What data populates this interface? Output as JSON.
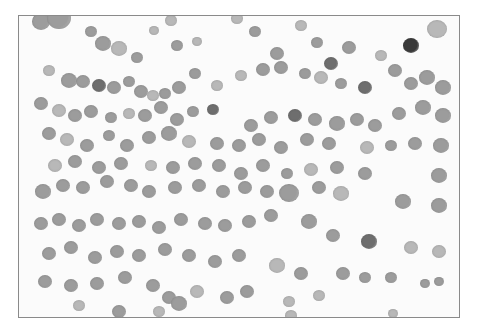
{
  "image": {
    "description": "Grayscale light micrograph of scattered round cells (cytology smear) within a thin gray border",
    "frame": {
      "x": 18,
      "y": 15,
      "width": 442,
      "height": 303,
      "border_color": "#8a8a8a",
      "background": "#fbfbfb"
    },
    "cell_colors": {
      "light": "#b8b8b8",
      "mid": "#9c9c9c",
      "dark": "#6e6e6e",
      "very_dark": "#3a3a3a"
    },
    "cells": [
      [
        22,
        6,
        9,
        "mid"
      ],
      [
        40,
        3,
        12,
        "mid"
      ],
      [
        72,
        16,
        6,
        "mid"
      ],
      [
        84,
        28,
        8,
        "mid"
      ],
      [
        100,
        33,
        8,
        "light"
      ],
      [
        118,
        42,
        6,
        "mid"
      ],
      [
        135,
        15,
        5,
        "light"
      ],
      [
        152,
        5,
        6,
        "light"
      ],
      [
        158,
        30,
        6,
        "mid"
      ],
      [
        178,
        26,
        5,
        "light"
      ],
      [
        218,
        3,
        6,
        "light"
      ],
      [
        236,
        16,
        6,
        "mid"
      ],
      [
        258,
        38,
        7,
        "mid"
      ],
      [
        282,
        10,
        6,
        "light"
      ],
      [
        298,
        27,
        6,
        "mid"
      ],
      [
        312,
        48,
        7,
        "dark"
      ],
      [
        330,
        32,
        7,
        "mid"
      ],
      [
        362,
        40,
        6,
        "light"
      ],
      [
        392,
        30,
        8,
        "very_dark"
      ],
      [
        418,
        14,
        10,
        "light"
      ],
      [
        30,
        55,
        6,
        "light"
      ],
      [
        50,
        65,
        8,
        "mid"
      ],
      [
        64,
        66,
        7,
        "mid"
      ],
      [
        80,
        70,
        7,
        "dark"
      ],
      [
        95,
        72,
        7,
        "mid"
      ],
      [
        110,
        66,
        6,
        "mid"
      ],
      [
        122,
        76,
        7,
        "mid"
      ],
      [
        134,
        80,
        6,
        "light"
      ],
      [
        146,
        78,
        6,
        "mid"
      ],
      [
        160,
        72,
        7,
        "mid"
      ],
      [
        176,
        58,
        6,
        "mid"
      ],
      [
        198,
        70,
        6,
        "light"
      ],
      [
        222,
        60,
        6,
        "light"
      ],
      [
        244,
        54,
        7,
        "mid"
      ],
      [
        262,
        52,
        7,
        "mid"
      ],
      [
        286,
        58,
        6,
        "mid"
      ],
      [
        302,
        62,
        7,
        "light"
      ],
      [
        322,
        68,
        6,
        "mid"
      ],
      [
        346,
        72,
        7,
        "dark"
      ],
      [
        376,
        55,
        7,
        "mid"
      ],
      [
        392,
        68,
        7,
        "mid"
      ],
      [
        408,
        62,
        8,
        "mid"
      ],
      [
        424,
        72,
        8,
        "mid"
      ],
      [
        22,
        88,
        7,
        "mid"
      ],
      [
        40,
        95,
        7,
        "light"
      ],
      [
        56,
        100,
        7,
        "mid"
      ],
      [
        72,
        96,
        7,
        "mid"
      ],
      [
        92,
        102,
        6,
        "mid"
      ],
      [
        110,
        98,
        6,
        "light"
      ],
      [
        126,
        100,
        7,
        "mid"
      ],
      [
        142,
        92,
        7,
        "mid"
      ],
      [
        158,
        104,
        7,
        "mid"
      ],
      [
        174,
        96,
        6,
        "mid"
      ],
      [
        194,
        94,
        6,
        "dark"
      ],
      [
        232,
        110,
        7,
        "mid"
      ],
      [
        252,
        102,
        7,
        "mid"
      ],
      [
        276,
        100,
        7,
        "dark"
      ],
      [
        296,
        104,
        7,
        "mid"
      ],
      [
        318,
        108,
        8,
        "mid"
      ],
      [
        338,
        104,
        7,
        "mid"
      ],
      [
        356,
        110,
        7,
        "mid"
      ],
      [
        380,
        98,
        7,
        "mid"
      ],
      [
        404,
        92,
        8,
        "mid"
      ],
      [
        424,
        100,
        8,
        "mid"
      ],
      [
        30,
        118,
        7,
        "mid"
      ],
      [
        48,
        124,
        7,
        "light"
      ],
      [
        68,
        130,
        7,
        "mid"
      ],
      [
        90,
        120,
        6,
        "mid"
      ],
      [
        108,
        130,
        7,
        "mid"
      ],
      [
        130,
        122,
        7,
        "mid"
      ],
      [
        150,
        118,
        8,
        "mid"
      ],
      [
        170,
        126,
        7,
        "light"
      ],
      [
        198,
        128,
        7,
        "mid"
      ],
      [
        220,
        130,
        7,
        "mid"
      ],
      [
        240,
        124,
        7,
        "mid"
      ],
      [
        262,
        132,
        7,
        "mid"
      ],
      [
        288,
        124,
        7,
        "mid"
      ],
      [
        310,
        128,
        7,
        "mid"
      ],
      [
        348,
        132,
        7,
        "light"
      ],
      [
        372,
        130,
        6,
        "mid"
      ],
      [
        396,
        128,
        7,
        "mid"
      ],
      [
        422,
        130,
        8,
        "mid"
      ],
      [
        36,
        150,
        7,
        "light"
      ],
      [
        56,
        146,
        7,
        "mid"
      ],
      [
        80,
        152,
        7,
        "mid"
      ],
      [
        102,
        148,
        7,
        "mid"
      ],
      [
        132,
        150,
        6,
        "light"
      ],
      [
        154,
        152,
        7,
        "mid"
      ],
      [
        176,
        148,
        7,
        "mid"
      ],
      [
        200,
        150,
        7,
        "mid"
      ],
      [
        222,
        158,
        7,
        "mid"
      ],
      [
        244,
        150,
        7,
        "mid"
      ],
      [
        268,
        158,
        6,
        "mid"
      ],
      [
        292,
        154,
        7,
        "light"
      ],
      [
        318,
        152,
        7,
        "mid"
      ],
      [
        346,
        158,
        7,
        "mid"
      ],
      [
        420,
        160,
        8,
        "mid"
      ],
      [
        24,
        176,
        8,
        "mid"
      ],
      [
        44,
        170,
        7,
        "mid"
      ],
      [
        64,
        172,
        7,
        "mid"
      ],
      [
        88,
        166,
        7,
        "mid"
      ],
      [
        112,
        170,
        7,
        "mid"
      ],
      [
        130,
        176,
        7,
        "mid"
      ],
      [
        156,
        172,
        7,
        "mid"
      ],
      [
        180,
        170,
        7,
        "mid"
      ],
      [
        204,
        176,
        7,
        "mid"
      ],
      [
        226,
        172,
        7,
        "mid"
      ],
      [
        248,
        176,
        7,
        "mid"
      ],
      [
        270,
        178,
        10,
        "mid"
      ],
      [
        300,
        172,
        7,
        "mid"
      ],
      [
        322,
        178,
        8,
        "light"
      ],
      [
        384,
        186,
        8,
        "mid"
      ],
      [
        420,
        190,
        8,
        "mid"
      ],
      [
        22,
        208,
        7,
        "mid"
      ],
      [
        40,
        204,
        7,
        "mid"
      ],
      [
        60,
        210,
        7,
        "mid"
      ],
      [
        78,
        204,
        7,
        "mid"
      ],
      [
        100,
        208,
        7,
        "mid"
      ],
      [
        120,
        206,
        7,
        "mid"
      ],
      [
        140,
        212,
        7,
        "mid"
      ],
      [
        162,
        204,
        7,
        "mid"
      ],
      [
        186,
        208,
        7,
        "mid"
      ],
      [
        206,
        210,
        7,
        "mid"
      ],
      [
        230,
        206,
        7,
        "mid"
      ],
      [
        252,
        200,
        7,
        "mid"
      ],
      [
        290,
        206,
        8,
        "mid"
      ],
      [
        314,
        220,
        7,
        "mid"
      ],
      [
        350,
        226,
        8,
        "dark"
      ],
      [
        392,
        232,
        7,
        "light"
      ],
      [
        420,
        236,
        7,
        "light"
      ],
      [
        30,
        238,
        7,
        "mid"
      ],
      [
        52,
        232,
        7,
        "mid"
      ],
      [
        76,
        242,
        7,
        "mid"
      ],
      [
        98,
        236,
        7,
        "mid"
      ],
      [
        120,
        240,
        7,
        "mid"
      ],
      [
        146,
        234,
        7,
        "mid"
      ],
      [
        170,
        240,
        7,
        "mid"
      ],
      [
        196,
        246,
        7,
        "mid"
      ],
      [
        220,
        240,
        7,
        "mid"
      ],
      [
        258,
        250,
        8,
        "light"
      ],
      [
        282,
        258,
        7,
        "mid"
      ],
      [
        324,
        258,
        7,
        "mid"
      ],
      [
        346,
        262,
        6,
        "mid"
      ],
      [
        372,
        262,
        6,
        "mid"
      ],
      [
        26,
        266,
        7,
        "mid"
      ],
      [
        52,
        270,
        7,
        "mid"
      ],
      [
        78,
        268,
        7,
        "mid"
      ],
      [
        106,
        262,
        7,
        "mid"
      ],
      [
        134,
        270,
        7,
        "mid"
      ],
      [
        150,
        282,
        7,
        "mid"
      ],
      [
        178,
        276,
        7,
        "light"
      ],
      [
        208,
        282,
        7,
        "mid"
      ],
      [
        228,
        276,
        7,
        "mid"
      ],
      [
        270,
        286,
        6,
        "light"
      ],
      [
        300,
        280,
        6,
        "light"
      ],
      [
        406,
        268,
        5,
        "mid"
      ],
      [
        420,
        266,
        5,
        "mid"
      ],
      [
        60,
        290,
        6,
        "light"
      ],
      [
        100,
        296,
        7,
        "mid"
      ],
      [
        140,
        296,
        6,
        "light"
      ],
      [
        160,
        288,
        8,
        "mid"
      ],
      [
        272,
        300,
        6,
        "light"
      ],
      [
        374,
        298,
        5,
        "light"
      ]
    ]
  }
}
